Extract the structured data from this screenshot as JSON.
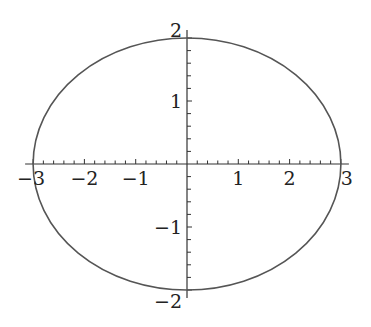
{
  "chart_data": {
    "type": "line",
    "title": "",
    "xlabel": "",
    "ylabel": "",
    "curve": {
      "shape": "ellipse",
      "center": [
        0,
        0
      ],
      "semi_axis_x": 3,
      "semi_axis_y": 2
    },
    "xlim": [
      -3,
      3
    ],
    "ylim": [
      -2,
      2
    ],
    "x_ticks": [
      -3,
      -2,
      -1,
      1,
      2,
      3
    ],
    "y_ticks": [
      -2,
      -1,
      1,
      2
    ],
    "x_tick_labels": [
      "−3",
      "−2",
      "−1",
      "1",
      "2",
      "3"
    ],
    "y_tick_labels": [
      "−2",
      "−1",
      "1",
      "2"
    ],
    "minor_tick_step": 0.2,
    "grid": false,
    "legend": null,
    "colors": {
      "curve": "#555555",
      "axes": "#333333",
      "text": "#222222"
    }
  }
}
